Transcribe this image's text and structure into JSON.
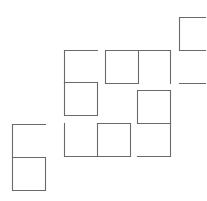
{
  "diagram": {
    "title": "",
    "line_color": "#6a6a6a",
    "cells": [
      {
        "id": "c1",
        "col": 4.75,
        "row": 0.5,
        "edges": [
          "top",
          "right",
          "bottom",
          "left"
        ]
      },
      {
        "id": "c2",
        "col": 4.75,
        "row": 1.5,
        "edges": [
          "right",
          "bottom"
        ]
      },
      {
        "id": "c3",
        "col": 1.2,
        "row": 1.5,
        "edges": [
          "top",
          "left"
        ]
      },
      {
        "id": "c4",
        "col": 2.45,
        "row": 1.5,
        "edges": [
          "top",
          "right",
          "bottom",
          "left"
        ]
      },
      {
        "id": "c5",
        "col": 3.45,
        "row": 1.5,
        "edges": [
          "top",
          "right"
        ]
      },
      {
        "id": "c6",
        "col": 1.2,
        "row": 2.5,
        "edges": [
          "top",
          "right",
          "bottom",
          "left"
        ]
      },
      {
        "id": "c7",
        "col": 3.45,
        "row": 2.75,
        "edges": [
          "top",
          "right",
          "bottom",
          "left"
        ]
      },
      {
        "id": "c8",
        "col": 3.45,
        "row": 3.75,
        "edges": [
          "right",
          "bottom"
        ]
      },
      {
        "id": "c9",
        "col": 1.2,
        "row": 3.75,
        "edges": [
          "left",
          "bottom"
        ]
      },
      {
        "id": "c10",
        "col": 2.2,
        "row": 3.75,
        "edges": [
          "top",
          "right",
          "bottom",
          "left"
        ]
      },
      {
        "id": "c11",
        "col": -0.4,
        "row": 3.8,
        "edges": [
          "top",
          "left"
        ]
      },
      {
        "id": "c12",
        "col": -0.4,
        "row": 4.8,
        "edges": [
          "top",
          "right",
          "bottom",
          "left"
        ]
      }
    ]
  }
}
